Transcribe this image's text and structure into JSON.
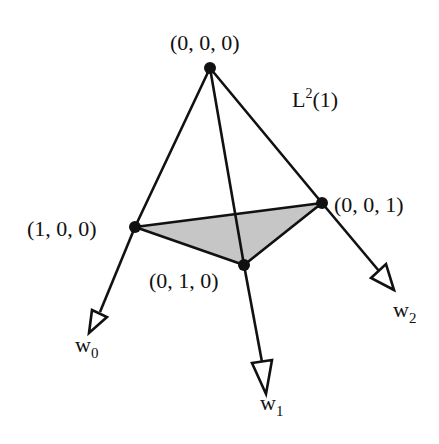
{
  "diagram": {
    "title_label": "L",
    "title_superscript": "2",
    "title_suffix": "(1)",
    "colors": {
      "stroke": "#111111",
      "face_fill": "#c6c6c6",
      "background": "#ffffff"
    },
    "vertices": [
      {
        "id": "v000",
        "label": "(0, 0, 0)",
        "x": 210,
        "y": 68
      },
      {
        "id": "v100",
        "label": "(1, 0, 0)",
        "x": 135,
        "y": 227
      },
      {
        "id": "v010",
        "label": "(0, 1, 0)",
        "x": 244,
        "y": 265
      },
      {
        "id": "v001",
        "label": "(0, 0, 1)",
        "x": 322,
        "y": 203
      }
    ],
    "shaded_face": [
      "(1, 0, 0)",
      "(0, 0, 1)",
      "(0, 1, 0)"
    ],
    "edges": [
      [
        "(0, 0, 0)",
        "(1, 0, 0)"
      ],
      [
        "(0, 0, 0)",
        "(0, 1, 0)"
      ],
      [
        "(0, 0, 0)",
        "(0, 0, 1)"
      ],
      [
        "(1, 0, 0)",
        "(0, 0, 1)"
      ],
      [
        "(1, 0, 0)",
        "(0, 1, 0)"
      ],
      [
        "(0, 1, 0)",
        "(0, 0, 1)"
      ]
    ],
    "rays": [
      {
        "from": "(1, 0, 0)",
        "label": "w",
        "subscript": "0"
      },
      {
        "from": "(0, 1, 0)",
        "label": "w",
        "subscript": "1"
      },
      {
        "from": "(0, 0, 1)",
        "label": "w",
        "subscript": "2"
      }
    ]
  }
}
